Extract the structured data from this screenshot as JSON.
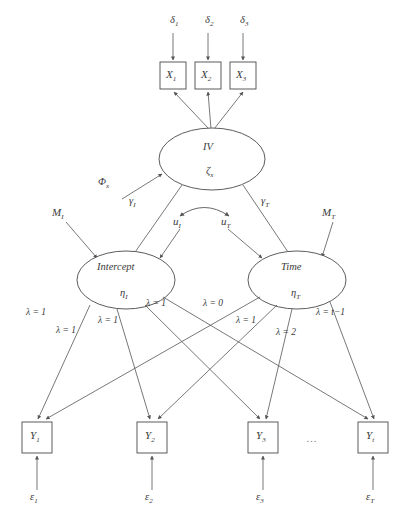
{
  "figure": {
    "type": "sem-path-diagram",
    "width": 400,
    "height": 525,
    "stroke_color": "#555555",
    "text_color": "#3a3a3a"
  },
  "exogenous_errors": [
    {
      "id": "delta1",
      "label": "δ",
      "sub": "1",
      "x": 170,
      "y": 22
    },
    {
      "id": "delta2",
      "label": "δ",
      "sub": "2",
      "x": 205,
      "y": 22
    },
    {
      "id": "delta3",
      "label": "δ",
      "sub": "3",
      "x": 240,
      "y": 22
    }
  ],
  "indicator_boxes": [
    {
      "id": "x1",
      "label": "X",
      "sub": "1",
      "x": 160,
      "y": 62,
      "w": 26,
      "h": 27
    },
    {
      "id": "x2",
      "label": "X",
      "sub": "2",
      "x": 195,
      "y": 62,
      "w": 26,
      "h": 27
    },
    {
      "id": "x3",
      "label": "X",
      "sub": "3",
      "x": 230,
      "y": 62,
      "w": 26,
      "h": 27
    }
  ],
  "latent_iv": {
    "id": "iv",
    "name": "IV",
    "disturbance": "ζ",
    "disturbance_sub": "x",
    "cx": 212,
    "cy": 159,
    "rx": 53,
    "ry": 31
  },
  "iv_variance": {
    "label": "Φ",
    "sub": "x",
    "x": 107,
    "y": 178
  },
  "gamma_paths": [
    {
      "id": "gamma-i",
      "label": "γ",
      "sub": "I",
      "x": 133,
      "y": 201
    },
    {
      "id": "gamma-t",
      "label": "γ",
      "sub": "T",
      "x": 265,
      "y": 201
    }
  ],
  "disturbances": [
    {
      "id": "u-i",
      "label": "u",
      "sub": "I",
      "x": 178,
      "y": 220
    },
    {
      "id": "u-t",
      "label": "u",
      "sub": "T",
      "x": 226,
      "y": 220
    }
  ],
  "means": [
    {
      "id": "m-i",
      "label": "M",
      "sub": "I",
      "x": 58,
      "y": 214
    },
    {
      "id": "m-t",
      "label": "M",
      "sub": "T",
      "x": 328,
      "y": 214
    }
  ],
  "growth_factors": [
    {
      "id": "intercept",
      "name": "Intercept",
      "eta": "η",
      "eta_sub": "I",
      "cx": 126,
      "cy": 280,
      "rx": 49,
      "ry": 29
    },
    {
      "id": "time",
      "name": "Time",
      "eta": "η",
      "eta_sub": "T",
      "cx": 297,
      "cy": 280,
      "rx": 49,
      "ry": 29
    }
  ],
  "loading_labels": [
    {
      "id": "lam-i-1",
      "text": "λ = 1",
      "x": 38,
      "y": 313
    },
    {
      "id": "lam-i-2",
      "text": "λ = 1",
      "x": 68,
      "y": 330
    },
    {
      "id": "lam-i-3",
      "text": "λ = 1",
      "x": 110,
      "y": 320
    },
    {
      "id": "lam-i-4",
      "text": "λ = 1",
      "x": 158,
      "y": 303
    },
    {
      "id": "lam-t-0",
      "text": "λ = 0",
      "x": 215,
      "y": 303
    },
    {
      "id": "lam-t-1",
      "text": "λ = 1",
      "x": 246,
      "y": 320
    },
    {
      "id": "lam-t-2",
      "text": "λ = 2",
      "x": 286,
      "y": 332
    },
    {
      "id": "lam-t-last",
      "text": "λ = t−1",
      "x": 330,
      "y": 313
    }
  ],
  "observed_boxes": [
    {
      "id": "y1",
      "label": "Y",
      "sub": "1",
      "x": 22,
      "y": 422,
      "w": 30,
      "h": 31
    },
    {
      "id": "y2",
      "label": "Y",
      "sub": "2",
      "x": 137,
      "y": 422,
      "w": 30,
      "h": 31
    },
    {
      "id": "y3",
      "label": "Y",
      "sub": "3",
      "x": 248,
      "y": 422,
      "w": 30,
      "h": 31
    },
    {
      "id": "yt",
      "label": "Y",
      "sub": "t",
      "x": 358,
      "y": 422,
      "w": 30,
      "h": 31
    }
  ],
  "residuals": [
    {
      "id": "eps1",
      "label": "ε",
      "sub": "1",
      "x": 33,
      "y": 497
    },
    {
      "id": "eps2",
      "label": "ε",
      "sub": "2",
      "x": 148,
      "y": 497
    },
    {
      "id": "eps3",
      "label": "ε",
      "sub": "3",
      "x": 259,
      "y": 497
    },
    {
      "id": "epst",
      "label": "ε",
      "sub": "T",
      "x": 369,
      "y": 497
    }
  ],
  "ellipsis": {
    "text": "…",
    "x": 312,
    "y": 440
  }
}
